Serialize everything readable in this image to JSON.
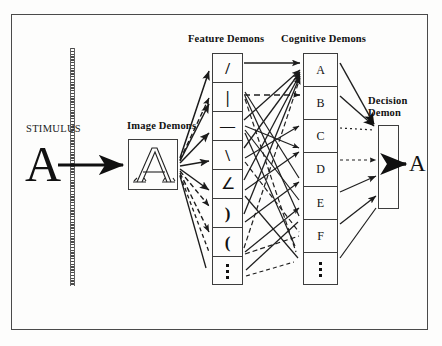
{
  "figure": {
    "background_color": "#fdfdfc",
    "ink_color": "#111111",
    "frame": {
      "name": "outer-border",
      "color": "#4a4a4a"
    }
  },
  "labels": {
    "stimulus": "STIMULUS",
    "image_demons": "Image Demons",
    "feature_demons": "Feature Demons",
    "cognitive_demons": "Cognitive Demons",
    "decision_demon_line1": "Decision",
    "decision_demon_line2": "Demon"
  },
  "stimulus": {
    "letter": "A",
    "barrier_name": "hatched-vertical-divider"
  },
  "image_demons": {
    "letter": "A",
    "style": "outline"
  },
  "feature_demons": {
    "count": 8,
    "cells": [
      {
        "glyph": "/",
        "name": "forward-slash-feature"
      },
      {
        "glyph": "|",
        "name": "vertical-line-feature"
      },
      {
        "glyph": "—",
        "name": "horizontal-line-feature"
      },
      {
        "glyph": "\\",
        "name": "back-slash-feature"
      },
      {
        "glyph": "∠",
        "name": "acute-angle-feature"
      },
      {
        "glyph": ")",
        "name": "right-curve-feature"
      },
      {
        "glyph": "(",
        "name": "left-curve-feature"
      },
      {
        "glyph": "⋮",
        "name": "ellipsis-feature"
      }
    ]
  },
  "cognitive_demons": {
    "count": 7,
    "cells": [
      {
        "glyph": "A",
        "name": "cognitive-demon-a"
      },
      {
        "glyph": "B",
        "name": "cognitive-demon-b"
      },
      {
        "glyph": "C",
        "name": "cognitive-demon-c"
      },
      {
        "glyph": "D",
        "name": "cognitive-demon-d"
      },
      {
        "glyph": "E",
        "name": "cognitive-demon-e"
      },
      {
        "glyph": "F",
        "name": "cognitive-demon-f"
      },
      {
        "glyph": "⋮",
        "name": "cognitive-demon-ellipsis"
      }
    ]
  },
  "decision_demon": {
    "output_letter": "A"
  },
  "chart_data": {
    "type": "diagram",
    "stages": [
      "Stimulus",
      "Image Demons",
      "Feature Demons",
      "Cognitive Demons",
      "Decision Demon",
      "Response"
    ],
    "feature_set": [
      "/",
      "|",
      "—",
      "\\",
      "∠",
      ")",
      "(",
      "⋮"
    ],
    "cognitive_set": [
      "A",
      "B",
      "C",
      "D",
      "E",
      "F",
      "⋮"
    ],
    "response": "A"
  }
}
